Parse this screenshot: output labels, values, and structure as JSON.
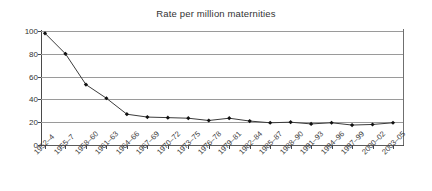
{
  "chart_data": {
    "type": "line",
    "title": "Rate per million maternities",
    "xlabel": "",
    "ylabel": "",
    "ylim": [
      0,
      100
    ],
    "yticks": [
      0,
      20,
      40,
      60,
      80,
      100
    ],
    "grid": true,
    "legend": false,
    "categories": [
      "1952–4",
      "1955–7",
      "1958–60",
      "1961–63",
      "1964–66",
      "1967–69",
      "1970–72",
      "1973–75",
      "1976–78",
      "1979–81",
      "1982–84",
      "1985–87",
      "1988–90",
      "1991–93",
      "1994–96",
      "1997–99",
      "2000–02",
      "2003–05"
    ],
    "values": [
      98,
      80,
      53,
      41,
      27,
      24.5,
      24,
      23.5,
      21.5,
      23.5,
      21,
      19.5,
      20,
      18.5,
      19.5,
      17.5,
      18,
      19.5
    ]
  }
}
